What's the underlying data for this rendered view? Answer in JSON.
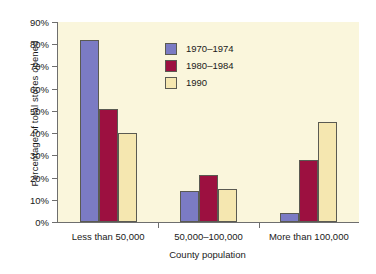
{
  "chart_data": {
    "type": "bar",
    "title": "",
    "xlabel": "County population",
    "ylabel": "Percentage of total stores opened",
    "categories": [
      "Less than 50,000",
      "50,000–100,000",
      "More than 100,000"
    ],
    "series": [
      {
        "name": "1970–1974",
        "values": [
          82,
          14,
          4
        ],
        "color": "#7b7bc4"
      },
      {
        "name": "1980–1984",
        "values": [
          51,
          21,
          28
        ],
        "color": "#9c1040"
      },
      {
        "name": "1990",
        "values": [
          40,
          15,
          45
        ],
        "color": "#f5e7b0"
      }
    ],
    "ylim": [
      0,
      90
    ],
    "yticks": [
      0,
      10,
      20,
      30,
      40,
      50,
      60,
      70,
      80,
      90
    ],
    "ytick_labels": [
      "0%",
      "10%",
      "20%",
      "30%",
      "40%",
      "50%",
      "60%",
      "70%",
      "80%",
      "90%"
    ],
    "grid": false,
    "legend_position": "upper-center-left",
    "plot_background": "#faf6dc",
    "page_background": "#ffffff",
    "axis_color": "#6e6e6e",
    "bar_outline": "#5a5a52"
  }
}
